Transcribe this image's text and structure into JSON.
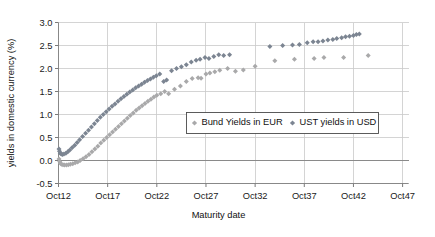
{
  "chart_data": {
    "type": "scatter",
    "title": "",
    "xlabel": "Maturity date",
    "ylabel": "yields in domestic currency (%)",
    "xlim": [
      2012.0,
      2047.6
    ],
    "ylim": [
      -0.5,
      3.0
    ],
    "xticks": [
      2012,
      2017,
      2022,
      2027,
      2032,
      2037,
      2042,
      2047
    ],
    "xticklabels": [
      "Oct12",
      "Oct17",
      "Oct22",
      "Oct27",
      "Oct32",
      "Oct37",
      "Oct42",
      "Oct47"
    ],
    "yticks": [
      -0.5,
      0.0,
      0.5,
      1.0,
      1.5,
      2.0,
      2.5,
      3.0
    ],
    "yticklabels": [
      "-0.5",
      "0.0",
      "0.5",
      "1.0",
      "1.5",
      "2.0",
      "2.5",
      "3.0"
    ],
    "grid": true,
    "legend_position": "center-right-inside",
    "series": [
      {
        "name": "Bund Yields in EUR",
        "color": "#a9a9aa",
        "marker": "diamond",
        "points": [
          [
            2012.05,
            0.03
          ],
          [
            2012.12,
            -0.02
          ],
          [
            2012.2,
            -0.06
          ],
          [
            2012.3,
            -0.08
          ],
          [
            2012.45,
            -0.09
          ],
          [
            2012.6,
            -0.1
          ],
          [
            2012.8,
            -0.1
          ],
          [
            2013.0,
            -0.09
          ],
          [
            2013.2,
            -0.08
          ],
          [
            2013.45,
            -0.07
          ],
          [
            2013.7,
            -0.05
          ],
          [
            2013.95,
            -0.03
          ],
          [
            2014.2,
            0.0
          ],
          [
            2014.5,
            0.04
          ],
          [
            2014.8,
            0.08
          ],
          [
            2015.1,
            0.13
          ],
          [
            2015.4,
            0.19
          ],
          [
            2015.7,
            0.25
          ],
          [
            2016.0,
            0.31
          ],
          [
            2016.3,
            0.38
          ],
          [
            2016.6,
            0.44
          ],
          [
            2016.9,
            0.5
          ],
          [
            2017.2,
            0.56
          ],
          [
            2017.5,
            0.62
          ],
          [
            2017.8,
            0.68
          ],
          [
            2018.1,
            0.74
          ],
          [
            2018.4,
            0.8
          ],
          [
            2018.7,
            0.86
          ],
          [
            2019.0,
            0.92
          ],
          [
            2019.3,
            0.98
          ],
          [
            2019.6,
            1.03
          ],
          [
            2019.9,
            1.09
          ],
          [
            2020.2,
            1.14
          ],
          [
            2020.5,
            1.19
          ],
          [
            2020.8,
            1.24
          ],
          [
            2021.1,
            1.29
          ],
          [
            2021.4,
            1.33
          ],
          [
            2021.7,
            1.38
          ],
          [
            2022.0,
            1.42
          ],
          [
            2022.4,
            1.45
          ],
          [
            2022.8,
            1.5
          ],
          [
            2023.2,
            1.45
          ],
          [
            2023.8,
            1.55
          ],
          [
            2024.4,
            1.62
          ],
          [
            2025.0,
            1.72
          ],
          [
            2025.6,
            1.78
          ],
          [
            2026.2,
            1.8
          ],
          [
            2026.5,
            1.79
          ],
          [
            2027.0,
            1.88
          ],
          [
            2027.4,
            1.9
          ],
          [
            2027.9,
            1.93
          ],
          [
            2028.4,
            1.96
          ],
          [
            2029.2,
            2.0
          ],
          [
            2030.0,
            1.94
          ],
          [
            2030.8,
            1.97
          ],
          [
            2032.0,
            2.05
          ],
          [
            2034.0,
            2.17
          ],
          [
            2036.0,
            2.2
          ],
          [
            2038.0,
            2.22
          ],
          [
            2039.0,
            2.24
          ],
          [
            2041.0,
            2.24
          ],
          [
            2043.5,
            2.28
          ]
        ]
      },
      {
        "name": "UST yields in USD",
        "color": "#7c8592",
        "marker": "diamond",
        "points": [
          [
            2012.05,
            0.25
          ],
          [
            2012.1,
            0.2
          ],
          [
            2012.18,
            0.16
          ],
          [
            2012.28,
            0.14
          ],
          [
            2012.4,
            0.13
          ],
          [
            2012.55,
            0.14
          ],
          [
            2012.75,
            0.16
          ],
          [
            2012.95,
            0.19
          ],
          [
            2013.15,
            0.23
          ],
          [
            2013.4,
            0.28
          ],
          [
            2013.65,
            0.33
          ],
          [
            2013.9,
            0.39
          ],
          [
            2014.15,
            0.45
          ],
          [
            2014.45,
            0.52
          ],
          [
            2014.75,
            0.59
          ],
          [
            2015.05,
            0.66
          ],
          [
            2015.35,
            0.73
          ],
          [
            2015.65,
            0.8
          ],
          [
            2015.95,
            0.87
          ],
          [
            2016.25,
            0.94
          ],
          [
            2016.55,
            1.0
          ],
          [
            2016.85,
            1.06
          ],
          [
            2017.15,
            1.12
          ],
          [
            2017.45,
            1.18
          ],
          [
            2017.75,
            1.23
          ],
          [
            2018.05,
            1.29
          ],
          [
            2018.35,
            1.34
          ],
          [
            2018.65,
            1.39
          ],
          [
            2018.95,
            1.44
          ],
          [
            2019.25,
            1.49
          ],
          [
            2019.55,
            1.53
          ],
          [
            2019.85,
            1.58
          ],
          [
            2020.15,
            1.62
          ],
          [
            2020.45,
            1.66
          ],
          [
            2020.75,
            1.7
          ],
          [
            2021.05,
            1.74
          ],
          [
            2021.35,
            1.77
          ],
          [
            2021.65,
            1.81
          ],
          [
            2021.95,
            1.84
          ],
          [
            2022.3,
            1.88
          ],
          [
            2022.7,
            1.72
          ],
          [
            2023.0,
            1.75
          ],
          [
            2023.5,
            1.95
          ],
          [
            2024.0,
            2.0
          ],
          [
            2024.5,
            2.04
          ],
          [
            2025.0,
            2.08
          ],
          [
            2025.5,
            2.14
          ],
          [
            2026.0,
            2.18
          ],
          [
            2026.4,
            2.2
          ],
          [
            2026.9,
            2.24
          ],
          [
            2027.3,
            2.22
          ],
          [
            2027.8,
            2.26
          ],
          [
            2028.3,
            2.3
          ],
          [
            2028.8,
            2.28
          ],
          [
            2029.4,
            2.3
          ],
          [
            2033.5,
            2.48
          ],
          [
            2034.8,
            2.5
          ],
          [
            2035.8,
            2.51
          ],
          [
            2036.5,
            2.52
          ],
          [
            2037.3,
            2.56
          ],
          [
            2037.9,
            2.58
          ],
          [
            2038.4,
            2.58
          ],
          [
            2038.9,
            2.6
          ],
          [
            2039.4,
            2.62
          ],
          [
            2039.9,
            2.63
          ],
          [
            2040.3,
            2.65
          ],
          [
            2040.8,
            2.67
          ],
          [
            2041.2,
            2.69
          ],
          [
            2041.6,
            2.7
          ],
          [
            2042.0,
            2.72
          ],
          [
            2042.3,
            2.74
          ],
          [
            2042.6,
            2.75
          ]
        ]
      }
    ],
    "legend": [
      {
        "label": "Bund Yields in EUR",
        "color": "#a9a9aa"
      },
      {
        "label": "UST yields in USD",
        "color": "#7c8592"
      }
    ]
  }
}
